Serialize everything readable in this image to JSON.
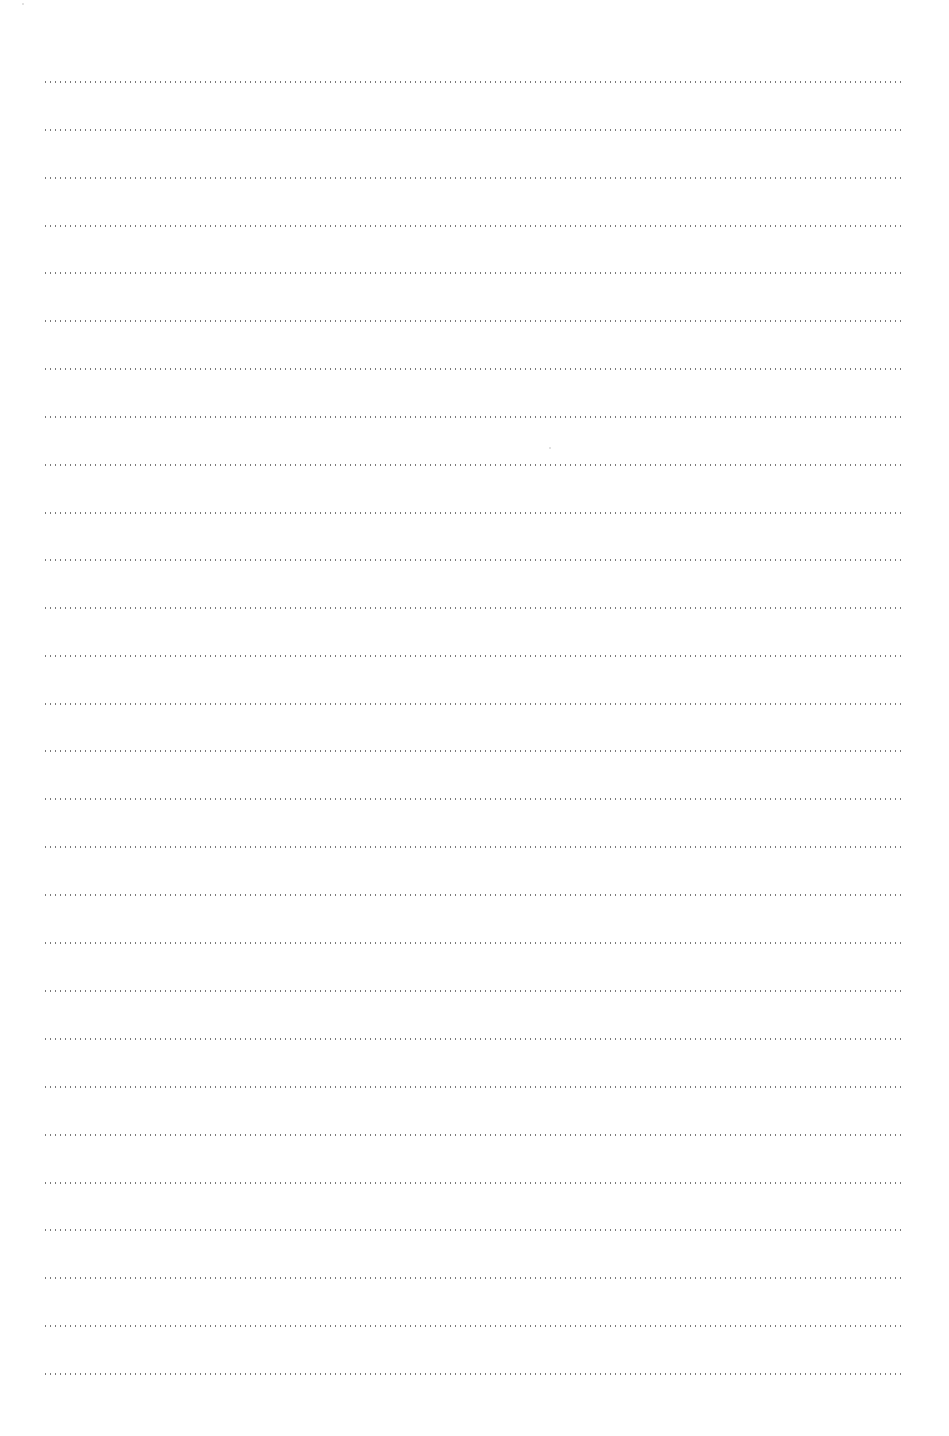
{
  "page": {
    "type": "blank lined writing sheet",
    "background_color": "#ffffff",
    "rule_color": "#7a7a7a",
    "rule_style": "dotted",
    "rule_count": 28,
    "rules_y": [
      82,
      130,
      178,
      226,
      273,
      321,
      369,
      417,
      465,
      513,
      560,
      608,
      656,
      704,
      751,
      799,
      847,
      895,
      943,
      991,
      1039,
      1087,
      1135,
      1183,
      1230,
      1278,
      1326,
      1374
    ],
    "rule_left": 43,
    "rule_right": 904,
    "text_lines": [
      "",
      "",
      "",
      "",
      "",
      "",
      "",
      "",
      "",
      "",
      "",
      "",
      "",
      "",
      "",
      "",
      "",
      "",
      "",
      "",
      "",
      "",
      "",
      "",
      "",
      "",
      "",
      ""
    ]
  }
}
